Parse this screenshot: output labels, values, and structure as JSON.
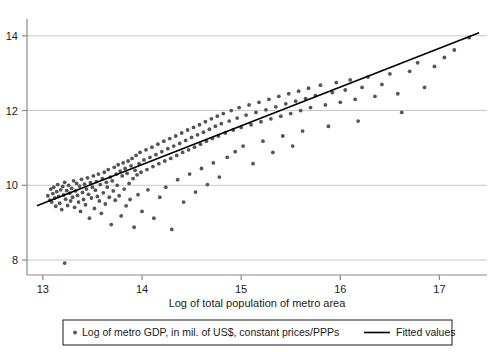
{
  "chart_data": {
    "type": "scatter",
    "title": "",
    "xlabel": "Log of total population of metro area",
    "ylabel": "",
    "xlim": [
      12.84,
      17.48
    ],
    "ylim": [
      7.6,
      14.45
    ],
    "xticks": [
      13,
      14,
      15,
      16,
      17
    ],
    "xtick_labels": [
      "13",
      "14",
      "15",
      "16",
      "17"
    ],
    "yticks": [
      8,
      10,
      12,
      14
    ],
    "ytick_labels": [
      "8",
      "10",
      "12",
      "14"
    ],
    "grid": "horizontal",
    "legend_position": "below",
    "series": [
      {
        "name": "Log of metro GDP, in mil. of US$, constant prices/PPPs",
        "type": "scatter",
        "marker": "circle",
        "color": "#555555",
        "points": [
          [
            13.05,
            9.72
          ],
          [
            13.07,
            9.6
          ],
          [
            13.08,
            9.9
          ],
          [
            13.09,
            9.55
          ],
          [
            13.1,
            9.78
          ],
          [
            13.11,
            9.95
          ],
          [
            13.12,
            9.66
          ],
          [
            13.13,
            9.44
          ],
          [
            13.14,
            9.83
          ],
          [
            13.15,
            10.02
          ],
          [
            13.16,
            9.7
          ],
          [
            13.17,
            9.52
          ],
          [
            13.18,
            9.88
          ],
          [
            13.19,
            9.35
          ],
          [
            13.2,
            9.97
          ],
          [
            13.21,
            9.74
          ],
          [
            13.22,
            10.08
          ],
          [
            13.22,
            7.92
          ],
          [
            13.23,
            9.63
          ],
          [
            13.24,
            9.86
          ],
          [
            13.25,
            9.46
          ],
          [
            13.26,
            10.0
          ],
          [
            13.27,
            9.79
          ],
          [
            13.28,
            9.58
          ],
          [
            13.29,
            9.92
          ],
          [
            13.3,
            9.68
          ],
          [
            13.31,
            10.12
          ],
          [
            13.32,
            9.41
          ],
          [
            13.33,
            9.85
          ],
          [
            13.34,
            10.05
          ],
          [
            13.35,
            9.73
          ],
          [
            13.36,
            9.55
          ],
          [
            13.37,
            9.98
          ],
          [
            13.38,
            9.3
          ],
          [
            13.39,
            10.16
          ],
          [
            13.4,
            9.81
          ],
          [
            13.41,
            9.62
          ],
          [
            13.42,
            10.03
          ],
          [
            13.43,
            9.48
          ],
          [
            13.44,
            9.9
          ],
          [
            13.45,
            10.2
          ],
          [
            13.46,
            9.76
          ],
          [
            13.47,
            9.12
          ],
          [
            13.48,
            10.07
          ],
          [
            13.49,
            9.66
          ],
          [
            13.5,
            9.95
          ],
          [
            13.51,
            10.25
          ],
          [
            13.52,
            9.38
          ],
          [
            13.53,
            9.87
          ],
          [
            13.54,
            10.1
          ],
          [
            13.55,
            9.7
          ],
          [
            13.56,
            10.3
          ],
          [
            13.57,
            9.58
          ],
          [
            13.58,
            10.02
          ],
          [
            13.59,
            9.25
          ],
          [
            13.6,
            10.18
          ],
          [
            13.61,
            9.8
          ],
          [
            13.62,
            10.35
          ],
          [
            13.63,
            9.5
          ],
          [
            13.64,
            10.08
          ],
          [
            13.65,
            9.95
          ],
          [
            13.66,
            10.42
          ],
          [
            13.67,
            9.68
          ],
          [
            13.68,
            10.22
          ],
          [
            13.69,
            8.95
          ],
          [
            13.7,
            10.12
          ],
          [
            13.71,
            9.85
          ],
          [
            13.72,
            10.48
          ],
          [
            13.73,
            9.6
          ],
          [
            13.74,
            10.3
          ],
          [
            13.75,
            10.0
          ],
          [
            13.76,
            10.55
          ],
          [
            13.77,
            9.72
          ],
          [
            13.78,
            10.38
          ],
          [
            13.79,
            9.18
          ],
          [
            13.8,
            10.25
          ],
          [
            13.81,
            10.6
          ],
          [
            13.82,
            9.9
          ],
          [
            13.83,
            10.45
          ],
          [
            13.84,
            9.45
          ],
          [
            13.85,
            10.32
          ],
          [
            13.86,
            10.65
          ],
          [
            13.87,
            10.05
          ],
          [
            13.88,
            9.62
          ],
          [
            13.89,
            10.52
          ],
          [
            13.9,
            10.72
          ],
          [
            13.91,
            10.18
          ],
          [
            13.92,
            8.88
          ],
          [
            13.93,
            10.4
          ],
          [
            13.94,
            10.8
          ],
          [
            13.95,
            10.28
          ],
          [
            13.96,
            9.75
          ],
          [
            13.97,
            10.58
          ],
          [
            13.98,
            10.88
          ],
          [
            13.99,
            10.35
          ],
          [
            14.0,
            9.3
          ],
          [
            14.02,
            10.68
          ],
          [
            14.04,
            10.95
          ],
          [
            14.05,
            10.42
          ],
          [
            14.06,
            9.88
          ],
          [
            14.08,
            10.75
          ],
          [
            14.1,
            11.02
          ],
          [
            14.11,
            10.5
          ],
          [
            14.12,
            9.12
          ],
          [
            14.14,
            10.82
          ],
          [
            14.16,
            11.1
          ],
          [
            14.17,
            10.58
          ],
          [
            14.18,
            9.68
          ],
          [
            14.2,
            10.9
          ],
          [
            14.22,
            11.18
          ],
          [
            14.23,
            10.65
          ],
          [
            14.24,
            9.95
          ],
          [
            14.26,
            10.98
          ],
          [
            14.28,
            11.25
          ],
          [
            14.29,
            10.72
          ],
          [
            14.3,
            8.82
          ],
          [
            14.32,
            11.05
          ],
          [
            14.34,
            11.32
          ],
          [
            14.35,
            10.8
          ],
          [
            14.36,
            10.15
          ],
          [
            14.38,
            11.12
          ],
          [
            14.4,
            11.4
          ],
          [
            14.41,
            10.88
          ],
          [
            14.42,
            9.55
          ],
          [
            14.44,
            11.2
          ],
          [
            14.46,
            11.48
          ],
          [
            14.47,
            10.95
          ],
          [
            14.48,
            10.3
          ],
          [
            14.5,
            11.28
          ],
          [
            14.52,
            11.55
          ],
          [
            14.53,
            11.02
          ],
          [
            14.54,
            9.82
          ],
          [
            14.56,
            11.35
          ],
          [
            14.58,
            11.62
          ],
          [
            14.59,
            11.1
          ],
          [
            14.6,
            10.45
          ],
          [
            14.62,
            11.42
          ],
          [
            14.64,
            11.7
          ],
          [
            14.65,
            11.18
          ],
          [
            14.66,
            10.02
          ],
          [
            14.68,
            11.5
          ],
          [
            14.7,
            11.78
          ],
          [
            14.71,
            11.25
          ],
          [
            14.72,
            10.6
          ],
          [
            14.74,
            11.58
          ],
          [
            14.76,
            11.85
          ],
          [
            14.77,
            11.32
          ],
          [
            14.78,
            10.22
          ],
          [
            14.8,
            11.65
          ],
          [
            14.82,
            11.92
          ],
          [
            14.84,
            11.4
          ],
          [
            14.86,
            10.75
          ],
          [
            14.88,
            11.72
          ],
          [
            14.9,
            12.0
          ],
          [
            14.92,
            11.48
          ],
          [
            14.94,
            10.9
          ],
          [
            14.96,
            11.8
          ],
          [
            14.98,
            12.08
          ],
          [
            15.0,
            11.55
          ],
          [
            15.02,
            11.05
          ],
          [
            15.05,
            11.88
          ],
          [
            15.08,
            12.15
          ],
          [
            15.1,
            11.62
          ],
          [
            15.12,
            10.58
          ],
          [
            15.15,
            11.95
          ],
          [
            15.18,
            12.22
          ],
          [
            15.2,
            11.7
          ],
          [
            15.22,
            11.18
          ],
          [
            15.25,
            12.02
          ],
          [
            15.28,
            12.3
          ],
          [
            15.3,
            11.78
          ],
          [
            15.32,
            10.88
          ],
          [
            15.35,
            12.1
          ],
          [
            15.38,
            12.38
          ],
          [
            15.4,
            11.85
          ],
          [
            15.42,
            11.32
          ],
          [
            15.45,
            12.18
          ],
          [
            15.48,
            12.45
          ],
          [
            15.5,
            11.92
          ],
          [
            15.52,
            11.05
          ],
          [
            15.55,
            12.25
          ],
          [
            15.58,
            12.52
          ],
          [
            15.6,
            12.0
          ],
          [
            15.62,
            11.45
          ],
          [
            15.65,
            12.32
          ],
          [
            15.68,
            12.6
          ],
          [
            15.7,
            12.08
          ],
          [
            15.75,
            12.4
          ],
          [
            15.8,
            12.68
          ],
          [
            15.85,
            12.15
          ],
          [
            15.88,
            11.58
          ],
          [
            15.92,
            12.48
          ],
          [
            15.96,
            12.75
          ],
          [
            16.0,
            12.22
          ],
          [
            16.05,
            12.55
          ],
          [
            16.1,
            12.82
          ],
          [
            16.15,
            12.3
          ],
          [
            16.18,
            11.72
          ],
          [
            16.22,
            12.62
          ],
          [
            16.28,
            12.9
          ],
          [
            16.35,
            12.38
          ],
          [
            16.42,
            12.7
          ],
          [
            16.5,
            12.98
          ],
          [
            16.58,
            12.45
          ],
          [
            16.62,
            11.95
          ],
          [
            16.7,
            13.05
          ],
          [
            16.78,
            13.28
          ],
          [
            16.85,
            12.62
          ],
          [
            16.95,
            13.18
          ],
          [
            17.05,
            13.42
          ],
          [
            17.15,
            13.62
          ],
          [
            17.3,
            13.95
          ]
        ]
      },
      {
        "name": "Fitted values",
        "type": "line",
        "color": "#000000",
        "endpoints": [
          [
            12.94,
            9.45
          ],
          [
            17.4,
            14.08
          ]
        ]
      }
    ]
  },
  "legend": {
    "items": [
      {
        "label": "Log of metro GDP, in mil. of US$, constant prices/PPPs",
        "symbol": "dot"
      },
      {
        "label": "Fitted values",
        "symbol": "line"
      }
    ]
  },
  "colors": {
    "marker": "#555555",
    "fit_line": "#000000",
    "axis": "#808080",
    "grid": "#c8c8c8",
    "text": "#1a1a1a",
    "background": "#ffffff"
  }
}
